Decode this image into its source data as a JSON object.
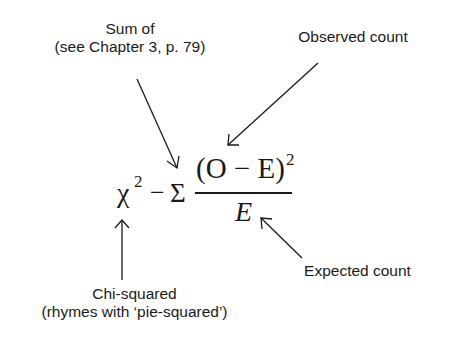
{
  "diagram": {
    "type": "annotated-formula",
    "formula": {
      "lhs": "χ",
      "lhs_exponent": "2",
      "operator": "−",
      "sum_symbol": "Σ",
      "numerator": "(O − E)",
      "numerator_exponent": "2",
      "denominator": "E"
    },
    "annotations": [
      {
        "id": "sum-of",
        "lines": [
          "Sum of",
          "(see Chapter 3, p. 79)"
        ],
        "points_to": "sum_symbol"
      },
      {
        "id": "observed",
        "lines": [
          "Observed count"
        ],
        "points_to": "numerator"
      },
      {
        "id": "expected",
        "lines": [
          "Expected count"
        ],
        "points_to": "denominator"
      },
      {
        "id": "chi-squared",
        "lines": [
          "Chi-squared",
          "(rhymes with ‘pie-squared’)"
        ],
        "points_to": "lhs"
      }
    ],
    "colors": {
      "text": "#1a1a1a",
      "background": "#ffffff"
    }
  }
}
